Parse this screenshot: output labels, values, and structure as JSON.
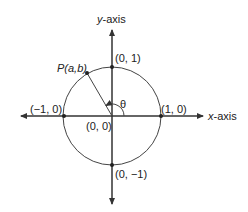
{
  "diagram": {
    "colors": {
      "stroke": "#333333",
      "text": "#222222",
      "background": "#ffffff"
    },
    "axes": {
      "x_label": "x-axis",
      "y_label": "y-axis"
    },
    "points": {
      "origin": "(0, 0)",
      "pos_x": "(1, 0)",
      "neg_x": "(−1, 0)",
      "pos_y": "(0, 1)",
      "neg_y": "(0, −1)",
      "p": "P(a,b)"
    },
    "angle_label": "θ"
  }
}
